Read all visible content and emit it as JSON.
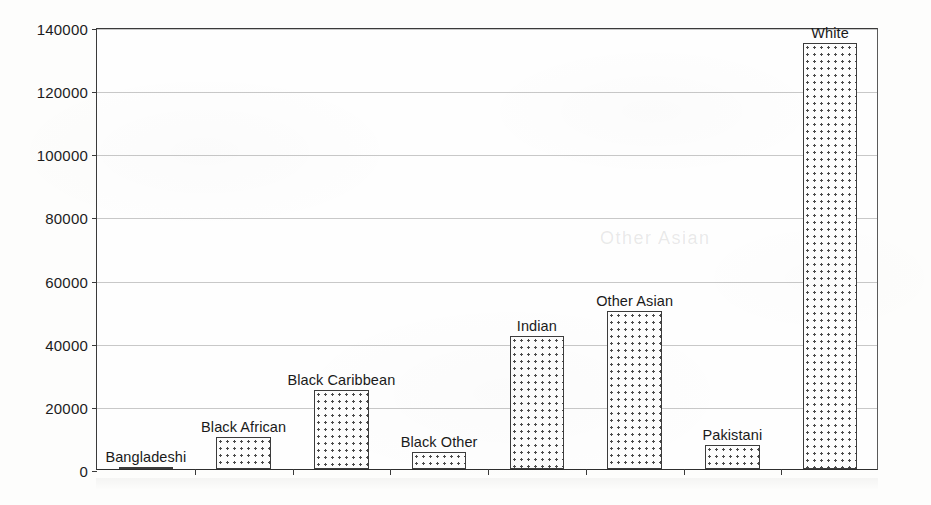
{
  "chart_data": {
    "type": "bar",
    "title": "",
    "xlabel": "",
    "ylabel": "",
    "categories": [
      "Bangladeshi",
      "Black African",
      "Black Caribbean",
      "Black Other",
      "Indian",
      "Other Asian",
      "Pakistani",
      "White"
    ],
    "values": [
      600,
      10000,
      25000,
      5500,
      42000,
      50000,
      7500,
      135000
    ],
    "ylim": [
      0,
      140000
    ],
    "ytick_labels": [
      "0",
      "20000",
      "40000",
      "60000",
      "80000",
      "100000",
      "120000",
      "140000"
    ],
    "ytick_values": [
      0,
      20000,
      40000,
      60000,
      80000,
      100000,
      120000,
      140000
    ],
    "grid": true,
    "legend": "none",
    "bar_fill": "dotted-pattern",
    "bar_edge_color": "#3c3c3c",
    "axis_color": "#3a3a3a",
    "gridline_color": "#c8c8c8",
    "data_labels_position": "above-bar"
  },
  "artifacts": {
    "ghost_text": "Other Asian"
  }
}
